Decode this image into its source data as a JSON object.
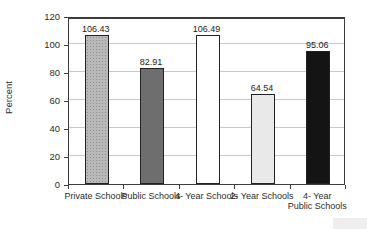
{
  "chart_data": {
    "type": "bar",
    "categories": [
      "Private Schools",
      "Public Schools",
      "4- Year Schools",
      "2- Year Schools",
      "4- Year\nPublic Schools"
    ],
    "values": [
      106.43,
      82.91,
      106.49,
      64.54,
      95.06
    ],
    "value_labels": [
      "106.43",
      "82.91",
      "106.49",
      "64.54",
      "95.06"
    ],
    "bar_colors": [
      "#b9b9b9",
      "#6e6e6e",
      "#ffffff",
      "#e9e9e9",
      "#141414"
    ],
    "bar_patterns": [
      "dots",
      "solid",
      "solid",
      "solid",
      "solid"
    ],
    "title": "",
    "xlabel": "",
    "ylabel": "Percent",
    "ylim": [
      0,
      120
    ],
    "y_ticks": [
      0,
      20,
      40,
      60,
      80,
      100,
      120
    ],
    "grid_values": [
      20,
      40,
      60,
      80,
      100
    ],
    "grid": "horizontal",
    "legend": "none",
    "gridline_color": "#c9c9c9",
    "axis_color": "#3c3c3c"
  }
}
